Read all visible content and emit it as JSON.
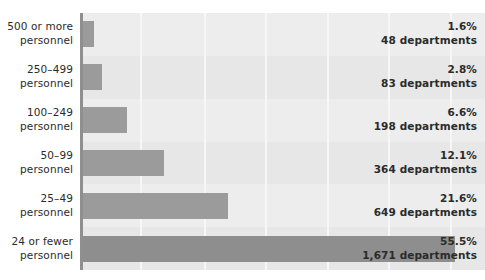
{
  "chart_data": {
    "type": "bar",
    "orientation": "horizontal",
    "title": "",
    "subtitle": "",
    "xlabel": "",
    "ylabel": "",
    "grid": true,
    "legend": false,
    "xlim": [
      0,
      60
    ],
    "value_unit": "percent",
    "categories": [
      "500 or more\npersonnel",
      "250–499\npersonnel",
      "100–249\npersonnel",
      "50–99\npersonnel",
      "25–49\npersonnel",
      "24 or fewer\npersonnel"
    ],
    "values": [
      1.6,
      2.8,
      6.6,
      12.1,
      21.6,
      55.5
    ],
    "counts": [
      48,
      83,
      198,
      364,
      649,
      1671
    ],
    "bars": [
      {
        "category_line1": "500 or more",
        "category_line2": "personnel",
        "percent": 1.6,
        "percent_label": "1.6%",
        "count": 48,
        "count_label": "48 departments",
        "color": "#9b9b9b"
      },
      {
        "category_line1": "250–499",
        "category_line2": "personnel",
        "percent": 2.8,
        "percent_label": "2.8%",
        "count": 83,
        "count_label": "83 departments",
        "color": "#9b9b9b"
      },
      {
        "category_line1": "100–249",
        "category_line2": "personnel",
        "percent": 6.6,
        "percent_label": "6.6%",
        "count": 198,
        "count_label": "198 departments",
        "color": "#9b9b9b"
      },
      {
        "category_line1": "50–99",
        "category_line2": "personnel",
        "percent": 12.1,
        "percent_label": "12.1%",
        "count": 364,
        "count_label": "364 departments",
        "color": "#9b9b9b"
      },
      {
        "category_line1": "25–49",
        "category_line2": "personnel",
        "percent": 21.6,
        "percent_label": "21.6%",
        "count": 649,
        "count_label": "649 departments",
        "color": "#9b9b9b"
      },
      {
        "category_line1": "24 or fewer",
        "category_line2": "personnel",
        "percent": 55.5,
        "percent_label": "55.5%",
        "count": 1671,
        "count_label": "1,671 departments",
        "color": "#8e8e8e"
      }
    ],
    "gridline_percents": [
      8.5,
      18.0,
      27.2,
      36.4,
      45.5,
      54.8
    ],
    "colors": {
      "plot_background": "#ebebeb",
      "gridline": "#f7f7f7",
      "bar": "#9b9b9b",
      "bar_emphasis": "#8e8e8e",
      "axis_spine": "#8f8f8f",
      "text": "#2b2b2b",
      "page_background": "#ffffff"
    }
  }
}
